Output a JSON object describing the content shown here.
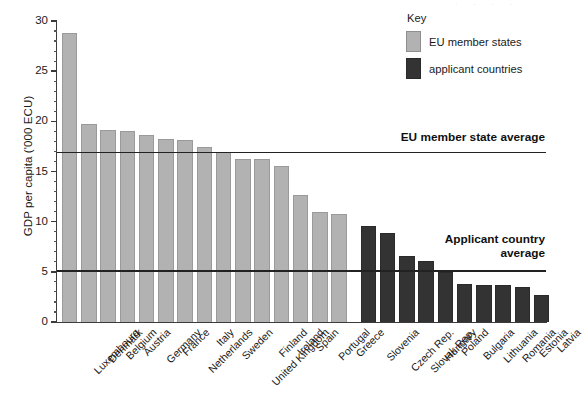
{
  "chart_data": {
    "type": "bar",
    "title": "",
    "xlabel": "",
    "ylabel": "GDP per capita ('000 ECU)",
    "ylim": [
      0,
      30
    ],
    "ytick_step": 5,
    "yminor_step": 1,
    "grid": false,
    "legend_position": "top-right",
    "ytick_labels": [
      "0",
      "5",
      "10",
      "15",
      "20",
      "25",
      "30"
    ],
    "categories": [
      "Luxembourg",
      "Denmark",
      "Belgium",
      "Austria",
      "Germany",
      "France",
      "Netherlands",
      "Italy",
      "Sweden",
      "United Kingdom",
      "Finland",
      "Ireland",
      "Spain",
      "Portugal",
      "Greece",
      "Slovenia",
      "Czech Rep.",
      "Slovak Rep.",
      "Hungary",
      "Poland",
      "Bulgaria",
      "Lithuania",
      "Romania",
      "Estonia",
      "Latvia"
    ],
    "values": [
      28.8,
      19.7,
      19.1,
      19.0,
      18.6,
      18.2,
      18.1,
      17.4,
      16.9,
      16.2,
      16.2,
      15.5,
      12.7,
      11.0,
      10.8,
      9.6,
      8.9,
      6.6,
      6.1,
      5.0,
      3.8,
      3.7,
      3.7,
      3.5,
      2.7
    ],
    "group_of": [
      "eu",
      "eu",
      "eu",
      "eu",
      "eu",
      "eu",
      "eu",
      "eu",
      "eu",
      "eu",
      "eu",
      "eu",
      "eu",
      "eu",
      "eu",
      "app",
      "app",
      "app",
      "app",
      "app",
      "app",
      "app",
      "app",
      "app",
      "app"
    ],
    "reference_lines": [
      {
        "label": "EU member state average",
        "value": 16.9,
        "group": "eu"
      },
      {
        "label": "Applicant country\naverage",
        "value": 5.1,
        "group": "app"
      }
    ],
    "colors": {
      "eu": "#b2b2b2",
      "applicant": "#333333",
      "reference_line": "#222222",
      "axis": "#3b3b3b",
      "background": "#ffffff"
    }
  },
  "legend": {
    "title": "Key",
    "entries": [
      {
        "label": "EU member states",
        "group": "eu"
      },
      {
        "label": "applicant countries",
        "group": "app"
      }
    ]
  }
}
